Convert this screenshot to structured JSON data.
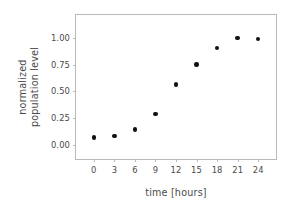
{
  "chart_data": {
    "type": "scatter",
    "title": "",
    "xlabel": "time [hours]",
    "ylabel_line1": "normalized",
    "ylabel_line2": "population level",
    "xlim": [
      -2.6,
      26.6
    ],
    "ylim": [
      -0.135,
      1.215
    ],
    "xticks": [
      0,
      3,
      6,
      9,
      12,
      15,
      18,
      21,
      24
    ],
    "xtick_labels": [
      "0",
      "3",
      "6",
      "9",
      "12",
      "15",
      "18",
      "21",
      "24"
    ],
    "yticks": [
      0.0,
      0.25,
      0.5,
      0.75,
      1.0
    ],
    "ytick_labels": [
      "0.00",
      "0.25",
      "0.50",
      "0.75",
      "1.00"
    ],
    "grid": false,
    "legend": null,
    "marker": "circle",
    "marker_color": "#111111",
    "x": [
      0,
      3,
      6,
      9,
      12,
      15,
      18,
      21,
      24
    ],
    "y": [
      0.065,
      0.08,
      0.14,
      0.285,
      0.565,
      0.75,
      0.905,
      1.0,
      0.99
    ],
    "points": [
      {
        "x": 0,
        "y": 0.065
      },
      {
        "x": 3,
        "y": 0.08
      },
      {
        "x": 6,
        "y": 0.14
      },
      {
        "x": 9,
        "y": 0.285
      },
      {
        "x": 12,
        "y": 0.565
      },
      {
        "x": 15,
        "y": 0.75
      },
      {
        "x": 18,
        "y": 0.905
      },
      {
        "x": 21,
        "y": 1.0
      },
      {
        "x": 24,
        "y": 0.99
      }
    ]
  },
  "figure": {
    "background_color": "#ffffff",
    "frame_color": "#b9b9b9",
    "text_color": "#4a4a4a"
  }
}
